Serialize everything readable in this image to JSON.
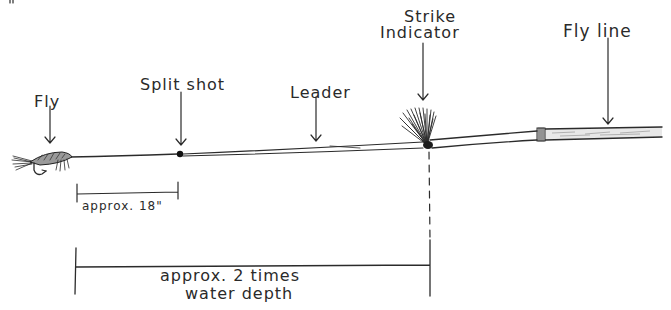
{
  "diagram": {
    "labels": {
      "fly": "Fly",
      "split_shot": "Split shot",
      "leader": "Leader",
      "strike_indicator_line1": "Strike",
      "strike_indicator_line2": "Indicator",
      "fly_line": "Fly line"
    },
    "measurements": {
      "fly_to_split_shot": "approx. 18\"",
      "fly_to_indicator_line1": "approx. 2 times",
      "fly_to_indicator_line2": "water depth"
    },
    "components": [
      {
        "id": "fly",
        "label": "Fly",
        "x": 42
      },
      {
        "id": "split-shot",
        "label": "Split shot",
        "x": 180
      },
      {
        "id": "leader",
        "label": "Leader",
        "x": 316
      },
      {
        "id": "strike-indicator",
        "label": "Strike Indicator",
        "x": 427
      },
      {
        "id": "connector",
        "label": "",
        "x": 541
      },
      {
        "id": "fly-line",
        "label": "Fly line",
        "x": 608
      }
    ],
    "colors": {
      "ink": "#2b2b2b",
      "paper": "#ffffff",
      "fly_line_fill": "#e6e6e6"
    }
  }
}
